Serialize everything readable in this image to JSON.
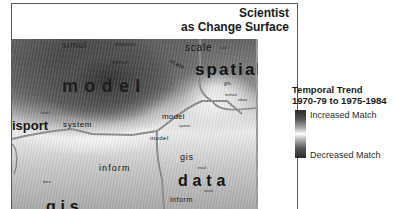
{
  "figure": {
    "title_line1": "Scientist",
    "title_line2": "as Change Surface"
  },
  "legend": {
    "title_line1": "Temporal Trend",
    "title_line2": "1970-79 to 1975-1984",
    "increased_label": "Increased Match",
    "decreased_label": "Decreased Match",
    "colors": {
      "dark": "#2b2b2b",
      "light": "#ffffff"
    }
  },
  "map_words": {
    "simul_top": "simul",
    "process": "process",
    "scale_top": "scale",
    "scale_small": "scale",
    "simul_mid": "simul",
    "scale_curved": "scale",
    "spatial": "spatial",
    "model_big": "model",
    "gis_small_right": "gis",
    "travel": "travel",
    "method": "method",
    "urban": "urban",
    "transport": "isport",
    "system": "system",
    "model_center": "model",
    "system_small": "system",
    "model_mid": "model",
    "gis_mid": "gis",
    "visual": "visual",
    "inform_left": "inform",
    "data": "data",
    "social": "social",
    "inform_bottom": "inform",
    "decis": "decis",
    "gis_bottom": "gis"
  }
}
